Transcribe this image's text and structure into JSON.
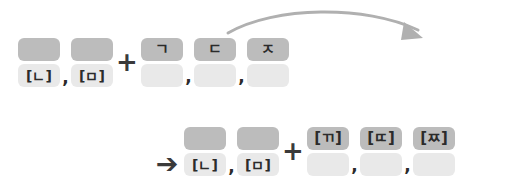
{
  "diagram": {
    "colors": {
      "box_top": "#bcbcbc",
      "box_bottom": "#e9e9e9",
      "glyph": "#2b2b2b",
      "operator": "#3a3a3a",
      "arc_arrow": "#b0b0b0",
      "background": "#ffffff"
    },
    "operators": {
      "plus": "+",
      "result_arrow": "➔",
      "comma": ","
    },
    "rows": [
      {
        "name": "input-row",
        "groups": [
          {
            "name": "nasal-group",
            "cells": [
              {
                "top": "",
                "bottom": "[ㄴ]"
              },
              {
                "top": "",
                "bottom": "[ㅁ]"
              }
            ]
          },
          {
            "name": "plain-stop-group",
            "cells": [
              {
                "top": "ㄱ",
                "bottom": ""
              },
              {
                "top": "ㄷ",
                "bottom": ""
              },
              {
                "top": "ㅈ",
                "bottom": ""
              }
            ]
          }
        ]
      },
      {
        "name": "output-row",
        "groups": [
          {
            "name": "nasal-group-result",
            "cells": [
              {
                "top": "",
                "bottom": "[ㄴ]"
              },
              {
                "top": "",
                "bottom": "[ㅁ]"
              }
            ]
          },
          {
            "name": "tense-stop-group",
            "cells": [
              {
                "top": "[ㄲ]",
                "bottom": ""
              },
              {
                "top": "[ㄸ]",
                "bottom": ""
              },
              {
                "top": "[ㅉ]",
                "bottom": ""
              }
            ]
          }
        ]
      }
    ]
  }
}
